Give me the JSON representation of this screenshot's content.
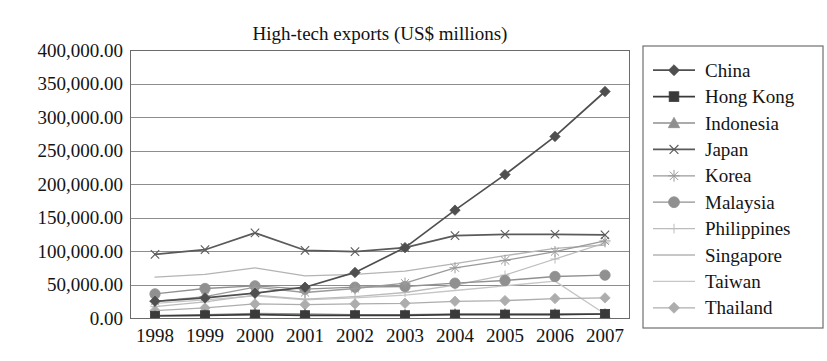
{
  "chart_data": {
    "type": "line",
    "title": "High-tech exports (US$ millions)",
    "xlabel": "",
    "ylabel": "",
    "grid": true,
    "legend_position": "right",
    "ylim": [
      0,
      400000
    ],
    "ytick_step": 50000,
    "ytick_labels": [
      "400,000.00",
      "350,000.00",
      "300,000.00",
      "250,000.00",
      "200,000.00",
      "150,000.00",
      "100,000.00",
      "50,000.00",
      "0.00"
    ],
    "ytick_values": [
      400000,
      350000,
      300000,
      250000,
      200000,
      150000,
      100000,
      50000,
      0
    ],
    "categories": [
      "1998",
      "1999",
      "2000",
      "2001",
      "2002",
      "2003",
      "2004",
      "2005",
      "2006",
      "2007"
    ],
    "x": [
      1998,
      1999,
      2000,
      2001,
      2002,
      2003,
      2004,
      2005,
      2006,
      2007
    ],
    "series": [
      {
        "name": "China",
        "marker": "diamond",
        "color": "#4f4f4f",
        "values": [
          25000,
          30000,
          37000,
          46000,
          68000,
          105000,
          161000,
          214000,
          271000,
          338000
        ]
      },
      {
        "name": "Hong Kong",
        "marker": "square",
        "color": "#3a3a3a",
        "values": [
          3000,
          4000,
          5000,
          4000,
          4000,
          4000,
          5000,
          5000,
          5000,
          6000
        ]
      },
      {
        "name": "Indonesia",
        "marker": "triangle",
        "color": "#8f8f8f",
        "values": [
          4000,
          5000,
          7000,
          6000,
          5000,
          5000,
          6000,
          6000,
          6000,
          6000
        ]
      },
      {
        "name": "Japan",
        "marker": "x-thin",
        "color": "#5a5a5a",
        "values": [
          95000,
          102000,
          127000,
          101000,
          99000,
          105000,
          123000,
          125000,
          125000,
          124000
        ]
      },
      {
        "name": "Korea",
        "marker": "asterisk",
        "color": "#9a9a9a",
        "values": [
          25000,
          32000,
          46000,
          38000,
          44000,
          52000,
          75000,
          86000,
          99000,
          115000
        ]
      },
      {
        "name": "Malaysia",
        "marker": "circle",
        "color": "#909090",
        "values": [
          36000,
          44000,
          48000,
          43000,
          46000,
          47000,
          52000,
          56000,
          62000,
          64000
        ]
      },
      {
        "name": "Philippines",
        "marker": "plus",
        "color": "#bcbcbc",
        "values": [
          17000,
          24000,
          34000,
          28000,
          32000,
          38000,
          49000,
          64000,
          88000,
          112000
        ]
      },
      {
        "name": "Singapore",
        "marker": "line",
        "color": "#b4b4b4",
        "values": [
          61000,
          65000,
          75000,
          63000,
          65000,
          70000,
          81000,
          93000,
          104000,
          109000
        ]
      },
      {
        "name": "Taiwan",
        "marker": "line",
        "color": "#c6c6c6",
        "values": [
          22000,
          27000,
          33000,
          27000,
          30000,
          34000,
          41000,
          48000,
          55000,
          6000
        ]
      },
      {
        "name": "Thailand",
        "marker": "diamond-light",
        "color": "#adadad",
        "values": [
          11000,
          15000,
          21000,
          20000,
          21000,
          22000,
          25000,
          26000,
          29000,
          30000
        ]
      }
    ]
  },
  "legend": {
    "items": [
      {
        "label": "China"
      },
      {
        "label": "Hong Kong"
      },
      {
        "label": "Indonesia"
      },
      {
        "label": "Japan"
      },
      {
        "label": "Korea"
      },
      {
        "label": "Malaysia"
      },
      {
        "label": "Philippines"
      },
      {
        "label": "Singapore"
      },
      {
        "label": "Taiwan"
      },
      {
        "label": "Thailand"
      }
    ]
  }
}
